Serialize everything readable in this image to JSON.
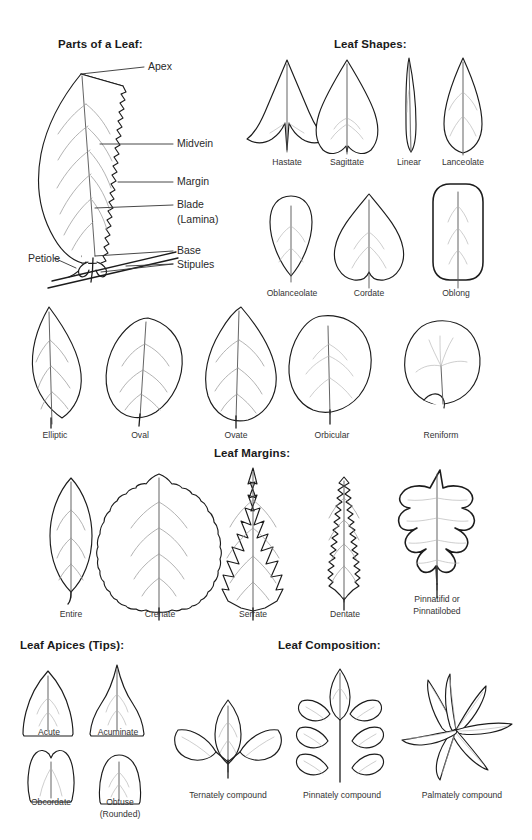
{
  "page": {
    "background": "#ffffff",
    "ink": "#1c1c1c",
    "vein_color": "#9a9a9a",
    "text_color": "#333333"
  },
  "sections": {
    "parts": {
      "title": "Parts of a Leaf:",
      "callouts": [
        {
          "name": "apex",
          "label": "Apex"
        },
        {
          "name": "midvein",
          "label": "Midvein"
        },
        {
          "name": "margin",
          "label": "Margin"
        },
        {
          "name": "blade",
          "label": "Blade"
        },
        {
          "name": "lamina",
          "label": "(Lamina)"
        },
        {
          "name": "petiole",
          "label": "Petiole"
        },
        {
          "name": "base",
          "label": "Base"
        },
        {
          "name": "stipules",
          "label": "Stipules"
        }
      ]
    },
    "shapes": {
      "title": "Leaf Shapes:",
      "row1": [
        "Hastate",
        "Sagittate",
        "Linear",
        "Lanceolate"
      ],
      "row2": [
        "Oblanceolate",
        "Cordate",
        "Oblong"
      ],
      "row3": [
        "Elliptic",
        "Oval",
        "Ovate",
        "Orbicular",
        "Reniform"
      ]
    },
    "margins": {
      "title": "Leaf Margins:",
      "items": [
        "Entire",
        "Crenate",
        "Serrate",
        "Dentate"
      ],
      "last_item_line1": "Pinnatifid or",
      "last_item_line2": "Pinnatilobed"
    },
    "apices": {
      "title": "Leaf Apices (Tips):",
      "items": [
        "Acute",
        "Acuminate",
        "Obcordate"
      ],
      "obtuse_line1": "Obtuse",
      "obtuse_line2": "(Rounded)"
    },
    "composition": {
      "title": "Leaf Composition:",
      "items": [
        "Ternately compound",
        "Pinnately compound",
        "Palmately compound"
      ]
    }
  }
}
